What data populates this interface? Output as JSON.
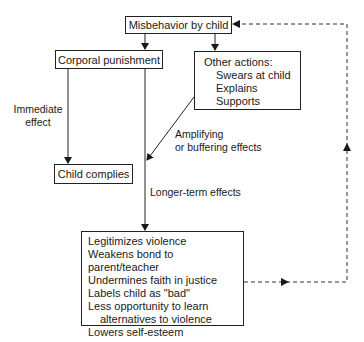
{
  "nodes": {
    "misbehavior": "Misbehavior by child",
    "corporal": "Corporal punishment",
    "other": {
      "title": "Other actions:",
      "items": [
        "Swears at child",
        "Explains",
        "Supports"
      ]
    },
    "complies": "Child complies",
    "effects": {
      "items": [
        "Legitimizes violence",
        "Weakens bond to parent/teacher",
        "Undermines faith in justice",
        "Labels child as \"bad\"",
        "Less opportunity to learn"
      ],
      "continuation": "alternatives to violence",
      "last": "Lowers self-esteem"
    }
  },
  "labels": {
    "immediate_1": "Immediate",
    "immediate_2": "effect",
    "amplifying_1": "Amplifying",
    "amplifying_2": "or buffering effects",
    "longer": "Longer-term effects"
  }
}
